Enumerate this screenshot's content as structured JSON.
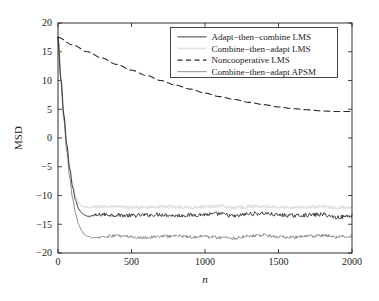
{
  "chart_data": {
    "type": "line",
    "title": "",
    "subtitle": "",
    "xlabel": "n",
    "ylabel": "MSD",
    "xlim": [
      0,
      2000
    ],
    "ylim": [
      -20,
      20
    ],
    "xticks": [
      0,
      500,
      1000,
      1500,
      2000
    ],
    "yticks": [
      20,
      15,
      10,
      5,
      0,
      -5,
      -10,
      -15,
      -20
    ],
    "xtick_labels": [
      "0",
      "500",
      "1000",
      "1500",
      "2000"
    ],
    "ytick_labels": [
      "20",
      "15",
      "10",
      "5",
      "0",
      "−5",
      "−10",
      "−15",
      "−20"
    ],
    "grid": false,
    "legend_position": "upper right",
    "background": "#ffffff",
    "axis_color": "#1a1a1a",
    "series": [
      {
        "name": "Adapt−then−combine LMS",
        "color": "#404040",
        "linestyle": "solid",
        "linewidth": 1.0,
        "start_value": 17.5,
        "steady_state": -13.5,
        "convergence_n": 200,
        "noise_amplitude": 0.35,
        "x": [
          0,
          20,
          40,
          60,
          80,
          100,
          120,
          140,
          160,
          180,
          200,
          250,
          300,
          400,
          500,
          600,
          700,
          800,
          900,
          1000,
          1100,
          1200,
          1300,
          1400,
          1500,
          1600,
          1700,
          1800,
          1900,
          2000
        ],
        "y": [
          17.5,
          10.2,
          4.0,
          -1.2,
          -5.4,
          -8.6,
          -10.9,
          -12.3,
          -13.0,
          -13.4,
          -13.6,
          -13.5,
          -13.3,
          -13.4,
          -13.5,
          -13.4,
          -13.3,
          -13.5,
          -13.4,
          -13.3,
          -13.2,
          -13.6,
          -13.2,
          -13.1,
          -13.4,
          -13.5,
          -13.4,
          -13.3,
          -13.8,
          -13.5
        ]
      },
      {
        "name": "Combine−then−adapt LMS",
        "color": "#e2e2e2",
        "linestyle": "solid",
        "linewidth": 1.6,
        "start_value": 17.5,
        "steady_state": -12.0,
        "convergence_n": 180,
        "noise_amplitude": 0.25,
        "x": [
          0,
          20,
          40,
          60,
          80,
          100,
          120,
          140,
          160,
          180,
          200,
          250,
          300,
          400,
          500,
          600,
          700,
          800,
          900,
          1000,
          1100,
          1200,
          1300,
          1400,
          1500,
          1600,
          1700,
          1800,
          1900,
          2000
        ],
        "y": [
          17.5,
          10.4,
          4.3,
          -0.9,
          -5.0,
          -8.1,
          -10.2,
          -11.3,
          -11.8,
          -12.0,
          -12.1,
          -12.0,
          -11.9,
          -12.0,
          -12.1,
          -12.0,
          -11.9,
          -12.0,
          -12.1,
          -11.9,
          -11.8,
          -12.1,
          -11.9,
          -11.8,
          -12.0,
          -12.1,
          -12.0,
          -11.9,
          -12.1,
          -12.0
        ]
      },
      {
        "name": "Noncooperative LMS",
        "color": "#2a2a2a",
        "linestyle": "dashed",
        "linewidth": 1.1,
        "start_value": 17.5,
        "steady_state": 4.6,
        "convergence_n": 1800,
        "noise_amplitude": 0.0,
        "x": [
          0,
          100,
          200,
          300,
          400,
          500,
          600,
          700,
          800,
          900,
          1000,
          1100,
          1200,
          1300,
          1400,
          1500,
          1600,
          1700,
          1800,
          1900,
          2000
        ],
        "y": [
          17.5,
          16.2,
          15.0,
          13.9,
          12.8,
          11.8,
          10.9,
          10.0,
          9.2,
          8.5,
          7.8,
          7.2,
          6.7,
          6.2,
          5.8,
          5.4,
          5.1,
          4.9,
          4.7,
          4.6,
          4.6
        ]
      },
      {
        "name": "Combine−then−adapt APSM",
        "color": "#8c8c8c",
        "linestyle": "solid",
        "linewidth": 1.0,
        "start_value": 17.5,
        "steady_state": -17.2,
        "convergence_n": 250,
        "noise_amplitude": 0.3,
        "x": [
          0,
          20,
          40,
          60,
          80,
          100,
          120,
          140,
          160,
          180,
          200,
          250,
          300,
          400,
          500,
          600,
          700,
          800,
          900,
          1000,
          1100,
          1200,
          1300,
          1400,
          1500,
          1600,
          1700,
          1800,
          1900,
          2000
        ],
        "y": [
          17.5,
          9.8,
          3.2,
          -2.4,
          -7.0,
          -10.6,
          -13.2,
          -15.0,
          -16.1,
          -16.8,
          -17.1,
          -17.4,
          -17.2,
          -17.0,
          -17.2,
          -17.3,
          -17.1,
          -17.0,
          -17.2,
          -17.1,
          -17.3,
          -17.4,
          -17.0,
          -16.9,
          -17.2,
          -17.3,
          -17.1,
          -17.0,
          -17.2,
          -17.1
        ]
      }
    ]
  },
  "legend": {
    "entries": [
      {
        "label": "Adapt−then−combine LMS",
        "swatch": "solid-dark-line-swatch"
      },
      {
        "label": "Combine−then−adapt LMS",
        "swatch": "solid-light-line-swatch"
      },
      {
        "label": "Noncooperative LMS",
        "swatch": "dashed-dark-line-swatch"
      },
      {
        "label": "Combine−then−adapt APSM",
        "swatch": "solid-gray-line-swatch"
      }
    ]
  }
}
